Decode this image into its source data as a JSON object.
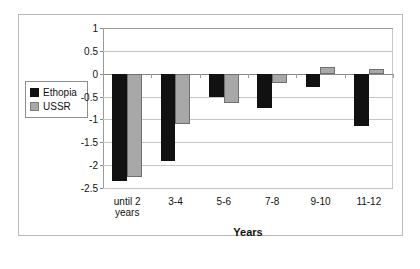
{
  "chart_data": {
    "type": "bar",
    "title": "",
    "xlabel": "Years",
    "ylabel": "",
    "categories": [
      "until 2 years",
      "3-4",
      "5-6",
      "7-8",
      "9-10",
      "11-12"
    ],
    "series": [
      {
        "name": "Ethopia",
        "color": "#111111",
        "values": [
          -2.35,
          -1.9,
          -0.5,
          -0.75,
          -0.3,
          -1.15
        ]
      },
      {
        "name": "USSR",
        "color": "#a8a8a8",
        "values": [
          -2.25,
          -1.1,
          -0.65,
          -0.2,
          0.15,
          0.1
        ]
      }
    ],
    "ylim": [
      -2.5,
      1
    ],
    "yticks": [
      1,
      0.5,
      0,
      -0.5,
      -1,
      -1.5,
      -2,
      -2.5
    ],
    "ytick_labels": [
      "1",
      "0.5",
      "0",
      "-0.5",
      "-1",
      "-1.5",
      "-2",
      "-2.5"
    ],
    "grid": true,
    "legend_position": "left-outside"
  },
  "legend": {
    "items": [
      {
        "label": "Ethopia",
        "swatch": "black-square-icon"
      },
      {
        "label": "USSR",
        "swatch": "gray-square-icon"
      }
    ]
  },
  "axis": {
    "x_title": "Years",
    "categories": [
      {
        "line1": "until 2",
        "line2": "years"
      },
      {
        "line1": "3-4",
        "line2": ""
      },
      {
        "line1": "5-6",
        "line2": ""
      },
      {
        "line1": "7-8",
        "line2": ""
      },
      {
        "line1": "9-10",
        "line2": ""
      },
      {
        "line1": "11-12",
        "line2": ""
      }
    ]
  },
  "colors": {
    "series_1": "#111111",
    "series_2": "#a8a8a8",
    "grid": "#c4c4c4",
    "frame": "#b9b9b9",
    "background": "#ffffff"
  }
}
